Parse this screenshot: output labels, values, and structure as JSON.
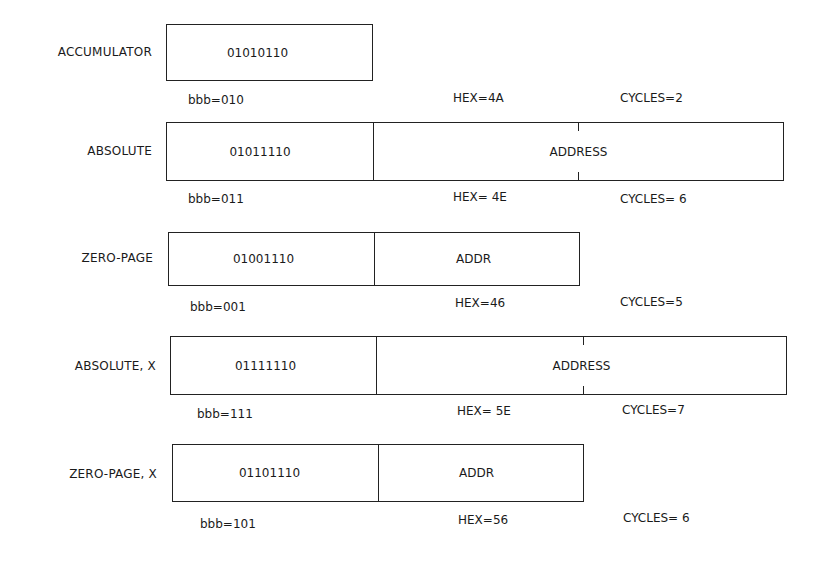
{
  "diagram": {
    "rows": [
      {
        "mode": "ACCUMULATOR",
        "opcode_bits": "01010110",
        "operand": "",
        "bbb": "bbb=010",
        "hex": "HEX=4A",
        "cycles": "CYCLES=2"
      },
      {
        "mode": "ABSOLUTE",
        "opcode_bits": "01011110",
        "operand": "ADDRESS",
        "bbb": "bbb=011",
        "hex": "HEX= 4E",
        "cycles": "CYCLES= 6"
      },
      {
        "mode": "ZERO-PAGE",
        "opcode_bits": "01001110",
        "operand": "ADDR",
        "bbb": "bbb=001",
        "hex": "HEX=46",
        "cycles": "CYCLES=5"
      },
      {
        "mode": "ABSOLUTE, X",
        "opcode_bits": "01111110",
        "operand": "ADDRESS",
        "bbb": "bbb=111",
        "hex": "HEX= 5E",
        "cycles": "CYCLES=7"
      },
      {
        "mode": "ZERO-PAGE, X",
        "opcode_bits": "01101110",
        "operand": "ADDR",
        "bbb": "bbb=101",
        "hex": "HEX=56",
        "cycles": "CYCLES= 6"
      }
    ]
  }
}
